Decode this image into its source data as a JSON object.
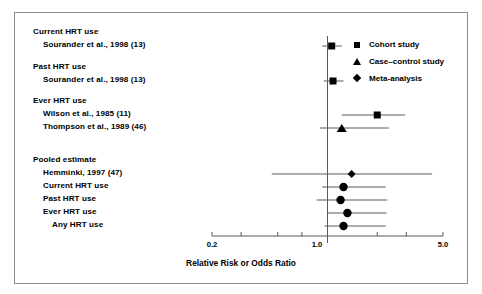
{
  "chart_data": {
    "type": "scatter",
    "subtype": "forest-plot",
    "title": "",
    "xlabel": "Relative Risk or Odds Ratio",
    "ylabel": "",
    "xscale": "log",
    "xlim": [
      0.2,
      5.0
    ],
    "reference_line": 1.0,
    "grid": false,
    "tick_values": [
      0.2,
      0.3,
      0.5,
      0.7,
      1.0,
      2.0,
      3.0,
      5.0
    ],
    "tick_labels_shown": [
      "0.2",
      "1.0",
      "5.0"
    ],
    "legend": {
      "position": "top-right",
      "entries": [
        {
          "label": "Cohort study",
          "marker": "square"
        },
        {
          "label": "Case–control study",
          "marker": "triangle"
        },
        {
          "label": "Meta-analysis",
          "marker": "diamond"
        }
      ]
    },
    "rows": [
      {
        "kind": "group",
        "label": "Current HRT use"
      },
      {
        "kind": "study",
        "label": "Sourander et al., 1998 (13)",
        "marker": "square",
        "estimate": 1.06,
        "ci_low": 0.93,
        "ci_high": 1.22
      },
      {
        "kind": "spacer",
        "label": ""
      },
      {
        "kind": "group",
        "label": "Past HRT use"
      },
      {
        "kind": "study",
        "label": "Sourander et al., 1998 (13)",
        "marker": "square",
        "estimate": 1.08,
        "ci_low": 0.95,
        "ci_high": 1.25
      },
      {
        "kind": "spacer",
        "label": ""
      },
      {
        "kind": "group",
        "label": "Ever HRT use"
      },
      {
        "kind": "study",
        "label": "Wilson et al., 1985 (11)",
        "marker": "square",
        "estimate": 2.0,
        "ci_low": 1.22,
        "ci_high": 2.95
      },
      {
        "kind": "study",
        "label": "Thompson et al., 1989 (46)",
        "marker": "triangle",
        "estimate": 1.22,
        "ci_low": 0.9,
        "ci_high": 2.35
      },
      {
        "kind": "spacer",
        "label": ""
      },
      {
        "kind": "spacer",
        "label": ""
      },
      {
        "kind": "group",
        "label": "Pooled estimate"
      },
      {
        "kind": "study",
        "label": "Hemminki, 1997 (47)",
        "marker": "diamond",
        "estimate": 1.4,
        "ci_low": 0.46,
        "ci_high": 4.3
      },
      {
        "kind": "study",
        "label": "Current HRT use",
        "marker": "circle",
        "estimate": 1.25,
        "ci_low": 0.93,
        "ci_high": 2.25
      },
      {
        "kind": "study",
        "label": "Past HRT use",
        "marker": "circle",
        "estimate": 1.2,
        "ci_low": 0.86,
        "ci_high": 2.3
      },
      {
        "kind": "study",
        "label": "Ever HRT use",
        "marker": "circle",
        "estimate": 1.32,
        "ci_low": 0.99,
        "ci_high": 2.28
      },
      {
        "kind": "study",
        "label": "Any HRT use",
        "marker": "circle",
        "estimate": 1.25,
        "ci_low": 0.96,
        "ci_high": 2.25
      }
    ]
  },
  "axis": {
    "title": "Relative Risk or Odds Ratio",
    "tick_low": "0.2",
    "tick_mid": "1.0",
    "tick_high": "5.0"
  },
  "labels": {
    "group_current": "Current HRT use",
    "study_sourander_current": "Sourander et al., 1998 (13)",
    "group_past": "Past HRT use",
    "study_sourander_past": "Sourander et al., 1998 (13)",
    "group_ever": "Ever HRT use",
    "study_wilson": "Wilson et al., 1985 (11)",
    "study_thompson": "Thompson et al., 1989 (46)",
    "group_pooled": "Pooled estimate",
    "study_hemminki": "Hemminki, 1997 (47)",
    "pooled_current": "Current HRT use",
    "pooled_past": "Past HRT use",
    "pooled_ever": "Ever HRT use",
    "pooled_any": "Any HRT use"
  },
  "legend": {
    "cohort": "Cohort study",
    "case_control": "Case–control study",
    "meta": "Meta-analysis"
  },
  "colors": {
    "marker": "#000000",
    "line": "#5a5a5a",
    "frame": "#8d8d8d",
    "background": "#ffffff"
  }
}
